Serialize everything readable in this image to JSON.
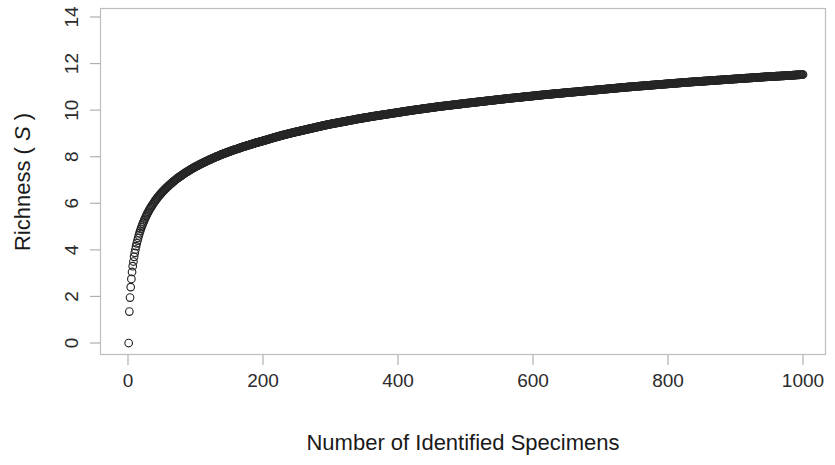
{
  "chart_data": {
    "type": "scatter",
    "title": "",
    "subtitle": "",
    "xlabel": "Number of Identified Specimens",
    "ylabel": "Richness ( S )",
    "ylabel_parts": {
      "prefix": "Richness (",
      "italic": "S",
      "suffix": ")"
    },
    "xlim": [
      0,
      1040
    ],
    "ylim": [
      -0.25,
      14.2
    ],
    "xticks": [
      0,
      200,
      400,
      600,
      800,
      1000
    ],
    "xticklabels": [
      "0",
      "200",
      "400",
      "600",
      "800",
      "1000"
    ],
    "yticks": [
      0,
      2,
      4,
      6,
      8,
      10,
      12,
      14
    ],
    "yticklabels": [
      "0",
      "2",
      "4",
      "6",
      "8",
      "10",
      "12",
      "14"
    ],
    "grid": false,
    "legend": null,
    "marker": "open-circle",
    "marker_color": "#262626",
    "marker_size": 5,
    "box_border": true,
    "box_color": "#b8b8b8",
    "series": [
      {
        "name": "Rarefaction curve",
        "x": [
          1,
          2,
          3,
          4,
          5,
          6,
          7,
          8,
          9,
          10,
          12,
          14,
          16,
          18,
          20,
          23,
          26,
          29,
          32,
          35,
          40,
          45,
          50,
          55,
          60,
          65,
          70,
          75,
          80,
          85,
          90,
          95,
          100,
          110,
          120,
          130,
          140,
          150,
          160,
          170,
          180,
          190,
          200,
          215,
          230,
          245,
          260,
          275,
          290,
          305,
          320,
          340,
          360,
          380,
          400,
          420,
          440,
          460,
          480,
          500,
          530,
          560,
          590,
          620,
          650,
          680,
          710,
          740,
          770,
          800,
          830,
          860,
          890,
          920,
          950,
          975,
          1000
        ],
        "y": [
          0.0,
          1.35,
          1.95,
          2.4,
          2.75,
          3.05,
          3.3,
          3.5,
          3.7,
          3.87,
          4.16,
          4.4,
          4.62,
          4.81,
          4.98,
          5.2,
          5.4,
          5.58,
          5.74,
          5.88,
          6.1,
          6.29,
          6.46,
          6.61,
          6.75,
          6.88,
          7.0,
          7.11,
          7.21,
          7.31,
          7.4,
          7.49,
          7.57,
          7.72,
          7.86,
          7.99,
          8.11,
          8.22,
          8.32,
          8.42,
          8.51,
          8.6,
          8.68,
          8.81,
          8.93,
          9.04,
          9.14,
          9.24,
          9.34,
          9.43,
          9.51,
          9.62,
          9.72,
          9.81,
          9.9,
          9.99,
          10.07,
          10.15,
          10.22,
          10.29,
          10.39,
          10.49,
          10.58,
          10.67,
          10.75,
          10.83,
          10.91,
          10.99,
          11.06,
          11.13,
          11.2,
          11.26,
          11.32,
          11.38,
          11.44,
          11.48,
          11.53
        ]
      }
    ],
    "note": "Rarefaction / species accumulation curve: richness rises steeply from 0 and saturates near 14 at 1000 specimens. Markers are open circles that overlap into a solid dark band at higher specimen counts."
  },
  "plot_geometry": {
    "box_left": 100,
    "box_top": 8,
    "box_right": 826,
    "box_bottom": 355,
    "x_zero_px": 128,
    "x_thousand_px": 803,
    "y_zero_px": 343,
    "y_fourteen_px": 17
  }
}
